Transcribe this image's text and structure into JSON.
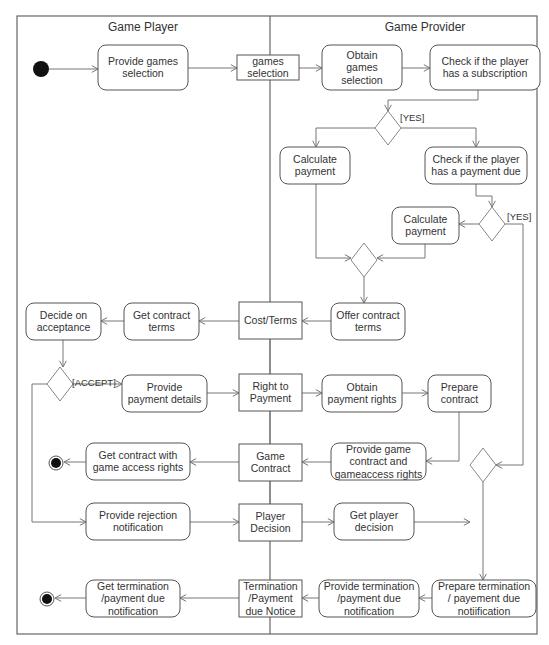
{
  "diagram": {
    "type": "UML activity diagram",
    "lanes": [
      {
        "id": "player",
        "title": "Game Player"
      },
      {
        "id": "provider",
        "title": "Game Provider"
      }
    ],
    "actions": {
      "provide_games_selection": [
        "Provide games",
        "selection"
      ],
      "obtain_games_selection": [
        "Obtain",
        "games",
        "selection"
      ],
      "check_subscription": [
        "Check if the player",
        "has a subscription"
      ],
      "calculate_payment_1": [
        "Calculate",
        "payment"
      ],
      "check_payment_due": [
        "Check if the player",
        "has a payment due"
      ],
      "calculate_payment_2": [
        "Calculate",
        "payment"
      ],
      "offer_contract_terms": [
        "Offer contract",
        "terms"
      ],
      "get_contract_terms": [
        "Get contract",
        "terms"
      ],
      "decide_on_acceptance": [
        "Decide on",
        "acceptance"
      ],
      "provide_payment_details": [
        "Provide",
        "payment details"
      ],
      "obtain_payment_rights": [
        "Obtain",
        "payment rights"
      ],
      "prepare_contract": [
        "Prepare",
        "contract"
      ],
      "provide_game_contract": [
        "Provide game",
        "contract and",
        "gameaccess rights"
      ],
      "get_contract_access_rights": [
        "Get contract with",
        "game access rights"
      ],
      "provide_rejection_notification": [
        "Provide rejection",
        "notification"
      ],
      "get_player_decision": [
        "Get player",
        "decision"
      ],
      "prepare_termination": [
        "Prepare termination",
        "/ payement due",
        "notiification"
      ],
      "provide_termination": [
        "Provide termination",
        "/payment due",
        "notification"
      ],
      "get_termination": [
        "Get termination",
        "/payment due",
        "notification"
      ]
    },
    "objects": {
      "games_selection": [
        "games",
        "selection"
      ],
      "cost_terms": [
        "Cost/Terms"
      ],
      "right_to_payment": [
        "Right to",
        "Payment"
      ],
      "game_contract": [
        "Game",
        "Contract"
      ],
      "player_decision": [
        "Player",
        "Decision"
      ],
      "termination_notice": [
        "Termination",
        "/Payment",
        "due Notice"
      ]
    },
    "guards": {
      "subscription_yes": "[YES]",
      "payment_due_yes": "[YES]",
      "accept": "[ACCEPT]"
    }
  }
}
